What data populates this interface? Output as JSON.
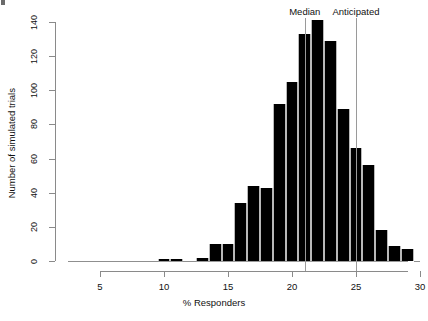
{
  "chart_data": {
    "type": "bar",
    "title": "",
    "subtitle": "",
    "xlabel": "% Responders",
    "ylabel": "Number of simulated trials",
    "xlim": [
      2.5,
      30.0
    ],
    "ylim": [
      0,
      145
    ],
    "grid": false,
    "legend": null,
    "bin_width": 1.0,
    "xticks": [
      5,
      10,
      15,
      20,
      25,
      30
    ],
    "xtick_labels": [
      "5",
      "10",
      "15",
      "20",
      "25",
      "30"
    ],
    "yticks": [
      0,
      20,
      40,
      60,
      80,
      100,
      120,
      140
    ],
    "ytick_labels": [
      "0",
      "20",
      "40",
      "60",
      "80",
      "100",
      "120",
      "140"
    ],
    "bins": [
      {
        "left": 2.5,
        "right": 3.5,
        "center": 3.0,
        "count": 0
      },
      {
        "left": 3.5,
        "right": 4.5,
        "center": 4.0,
        "count": 0
      },
      {
        "left": 4.5,
        "right": 5.5,
        "center": 5.0,
        "count": 0
      },
      {
        "left": 5.5,
        "right": 6.5,
        "center": 6.0,
        "count": 0
      },
      {
        "left": 6.5,
        "right": 7.5,
        "center": 7.0,
        "count": 0
      },
      {
        "left": 7.5,
        "right": 8.5,
        "center": 8.0,
        "count": 0
      },
      {
        "left": 8.5,
        "right": 9.5,
        "center": 9.0,
        "count": 0
      },
      {
        "left": 9.5,
        "right": 10.5,
        "center": 10.0,
        "count": 1
      },
      {
        "left": 10.5,
        "right": 11.5,
        "center": 11.0,
        "count": 1
      },
      {
        "left": 11.5,
        "right": 12.5,
        "center": 12.0,
        "count": 0
      },
      {
        "left": 12.5,
        "right": 13.5,
        "center": 13.0,
        "count": 2
      },
      {
        "left": 13.5,
        "right": 14.5,
        "center": 14.0,
        "count": 10
      },
      {
        "left": 14.5,
        "right": 15.5,
        "center": 15.0,
        "count": 10
      },
      {
        "left": 15.5,
        "right": 16.5,
        "center": 16.0,
        "count": 34
      },
      {
        "left": 16.5,
        "right": 17.5,
        "center": 17.0,
        "count": 44
      },
      {
        "left": 17.5,
        "right": 18.5,
        "center": 18.0,
        "count": 43
      },
      {
        "left": 18.5,
        "right": 19.5,
        "center": 19.0,
        "count": 92
      },
      {
        "left": 19.5,
        "right": 20.5,
        "center": 20.0,
        "count": 105
      },
      {
        "left": 20.5,
        "right": 21.5,
        "center": 21.0,
        "count": 133
      },
      {
        "left": 21.5,
        "right": 22.5,
        "center": 22.0,
        "count": 141
      },
      {
        "left": 22.5,
        "right": 23.5,
        "center": 23.0,
        "count": 129
      },
      {
        "left": 23.5,
        "right": 24.5,
        "center": 24.0,
        "count": 89
      },
      {
        "left": 24.5,
        "right": 25.5,
        "center": 25.0,
        "count": 66
      },
      {
        "left": 25.5,
        "right": 26.5,
        "center": 26.0,
        "count": 56
      },
      {
        "left": 26.5,
        "right": 27.5,
        "center": 27.0,
        "count": 18
      },
      {
        "left": 27.5,
        "right": 28.5,
        "center": 28.0,
        "count": 9
      },
      {
        "left": 28.5,
        "right": 29.5,
        "center": 29.0,
        "count": 7
      },
      {
        "left": 29.5,
        "right": 30.0,
        "center": 29.8,
        "count": 0
      }
    ],
    "annotations": [
      {
        "name": "median",
        "label": "Median",
        "x": 21.0,
        "type": "vline"
      },
      {
        "name": "anticipated",
        "label": "Anticipated",
        "x": 25.0,
        "type": "vline"
      }
    ]
  }
}
